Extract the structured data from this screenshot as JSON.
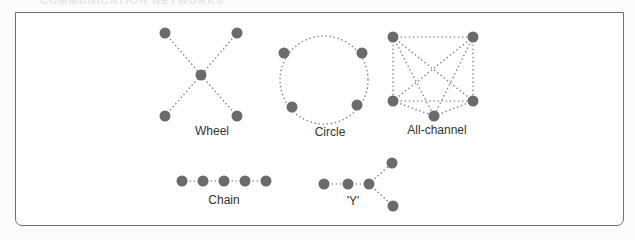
{
  "figure": {
    "title_fragment": "COMMUNICATION NETWORKS",
    "node_color": "#6b6b6b",
    "edge_color": "#8a8a8a",
    "frame_color": "#6f6f6f"
  },
  "networks": [
    {
      "id": "wheel",
      "label": "Wheel",
      "label_pos": [
        212,
        135
      ],
      "nodes": [
        [
          165,
          33
        ],
        [
          237,
          33
        ],
        [
          201,
          75
        ],
        [
          165,
          116
        ],
        [
          237,
          116
        ]
      ],
      "edges": [
        [
          0,
          2
        ],
        [
          1,
          2
        ],
        [
          3,
          2
        ],
        [
          4,
          2
        ]
      ]
    },
    {
      "id": "circle",
      "label": "Circle",
      "label_pos": [
        330,
        136
      ],
      "circle": {
        "cx": 324,
        "cy": 80,
        "r": 44
      },
      "nodes": [
        [
          284,
          53
        ],
        [
          362,
          53
        ],
        [
          292,
          107
        ],
        [
          357,
          105
        ]
      ],
      "edges": []
    },
    {
      "id": "all-channel",
      "label": "All-channel",
      "label_pos": [
        437,
        134
      ],
      "nodes": [
        [
          393,
          37
        ],
        [
          473,
          37
        ],
        [
          393,
          101
        ],
        [
          473,
          101
        ],
        [
          434,
          116
        ]
      ],
      "edges": [
        [
          0,
          1
        ],
        [
          0,
          2
        ],
        [
          0,
          3
        ],
        [
          0,
          4
        ],
        [
          1,
          2
        ],
        [
          1,
          3
        ],
        [
          1,
          4
        ],
        [
          2,
          3
        ],
        [
          2,
          4
        ],
        [
          3,
          4
        ]
      ]
    },
    {
      "id": "chain",
      "label": "Chain",
      "label_pos": [
        224,
        204
      ],
      "nodes": [
        [
          182,
          181
        ],
        [
          203,
          181
        ],
        [
          224,
          181
        ],
        [
          245,
          181
        ],
        [
          266,
          181
        ]
      ],
      "edges": [
        [
          0,
          1
        ],
        [
          1,
          2
        ],
        [
          2,
          3
        ],
        [
          3,
          4
        ]
      ]
    },
    {
      "id": "y",
      "label": "'Y'",
      "label_pos": [
        353,
        205
      ],
      "nodes": [
        [
          324,
          184
        ],
        [
          348,
          184
        ],
        [
          369,
          184
        ],
        [
          392,
          163
        ],
        [
          393,
          206
        ]
      ],
      "edges": [
        [
          0,
          1
        ],
        [
          1,
          2
        ],
        [
          2,
          3
        ],
        [
          2,
          4
        ]
      ]
    }
  ]
}
